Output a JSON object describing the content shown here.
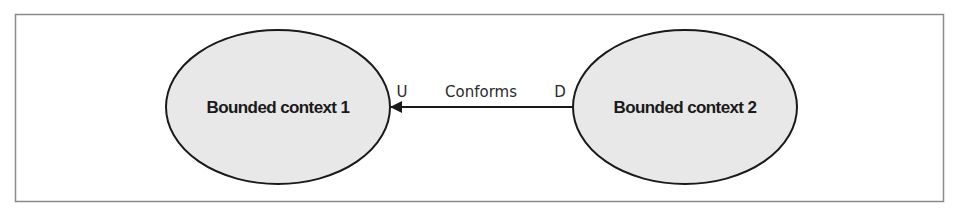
{
  "diagram": {
    "nodes": [
      {
        "id": "bc1",
        "label": "Bounded context 1",
        "shape": "ellipse"
      },
      {
        "id": "bc2",
        "label": "Bounded context 2",
        "shape": "ellipse"
      }
    ],
    "edge": {
      "from": "bc2",
      "to": "bc1",
      "label": "Conforms",
      "upstream_marker": "U",
      "downstream_marker": "D"
    },
    "colors": {
      "node_fill": "#e8e8e8",
      "stroke": "#1a1a1a",
      "frame": "#8a8a8a"
    }
  }
}
